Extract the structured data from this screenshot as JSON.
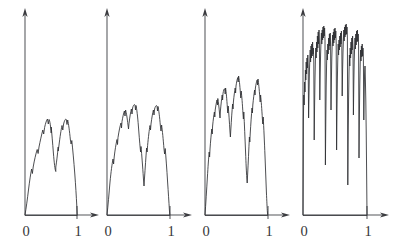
{
  "figure": {
    "title": "",
    "background_color": "#ffffff",
    "ink_color": "#2d2e32",
    "axis_color": "#55565a",
    "width": 399,
    "height": 245,
    "panel_count": 4
  },
  "chart_data": {
    "type": "line",
    "title": "",
    "xlabel": "",
    "ylabel": "",
    "xlim": [
      0,
      1
    ],
    "ylim": [
      0,
      1
    ],
    "grid": false,
    "legend": null,
    "shared_tick_labels": [
      "0",
      "1"
    ],
    "shared_tick_x": [
      0,
      1
    ],
    "panels": [
      {
        "name": "iteration-1",
        "index": 0,
        "label_zero": "0",
        "label_one": "1",
        "peak_height": 0.46,
        "detail_level": 1,
        "origin_px": [
          25,
          215
        ],
        "unit_x_px": 77,
        "axis_top_px": 8,
        "path": "M25,215 C26.2,208 27.4,199 28.6,189 C29.6,181 30.6,174 31.6,169 L32.4,173.5 L33.2,167 C34.4,160 35.8,154 37.2,149.5 L38.1,153.5 L39.0,147 C40.2,141 41.5,135 42.8,130 L43.7,134 L44.6,127.5 C45.6,123 46.6,120 47.5,119 L48.3,124 L49.1,119.5 C49.9,121 50.6,126 51.2,133 L51.2,133 L51.2,127 C51.9,134 52.6,143 53.4,153 C54.2,163 55.0,170 55.8,171.5 L55.8,171.5 L55.8,167 C56.6,162 57.4,155 58.2,147 L58.2,147 L58.2,151 L59.0,145 C60.0,137 61.0,130 62.0,125.5 L62.8,130 L63.6,124 C64.6,120 65.5,118.5 66.3,119.5 L67.0,124.5 L67.7,120 C68.6,124 69.5,131 70.4,140 L71.1,144 L71.8,140.5 C72.8,150 73.8,161 74.8,174 C75.6,185 76.3,196 76.8,206 L77.2,215 Z"
      },
      {
        "name": "iteration-2",
        "index": 1,
        "label_zero": "0",
        "label_one": "1",
        "peak_height": 0.6,
        "detail_level": 2,
        "origin_px": [
          107,
          215
        ],
        "unit_x_px": 170,
        "axis_top_px": 8,
        "path": "M107,215 C108,206 109,194 110,182 C111,172 112,164 113,159 L113.6,164 L114.2,157 C115,150 116,144 117,139.5 L117.5,144.5 L118,137.5 C119,131 120,126 121,123 L121.5,128 L122,121.5 C122.8,117 123.6,113 124.4,111 L125,116 L125.6,110 C126.4,113 127.2,118 128,125 L128.5,129 L129,123.5 C129.8,117 130.6,112 131.4,109 L132,114 L132.6,108 C133.4,105 134.2,104 135,105 L135.5,110 L136,105.5 C136.8,109 137.6,116 138.4,126 C139,134 139.6,142 140.2,148 L140.6,152 L141,146.5 C141.8,155 142.6,166 143.4,178 L144,186 L144.5,178 C145.2,168 145.9,157 146.6,148 L147.1,152 L147.6,145.5 C148.4,137 149.2,130 150,125.5 L150.5,130 L151,124 C151.8,118 152.6,113 153.4,110 L154,115 L154.6,109 C155.4,106 156.2,105 157,106 L157.5,111 L158,106.5 C158.8,110 159.6,117 160.4,126 L161,131 L161.6,125 C162.4,131 163.2,139 164,149 L164.6,154 L165.2,148.5 C166,158 166.8,169 167.6,182 C168.3,192 168.9,202 169.4,210 L169.8,215 Z"
      },
      {
        "name": "iteration-3",
        "index": 2,
        "label_zero": "0",
        "label_one": "1",
        "peak_height": 0.72,
        "detail_level": 3,
        "origin_px": [
          205,
          215
        ],
        "unit_x_px": 268,
        "axis_top_px": 8,
        "path": "M205,215 C205.8,204 206.6,190 207.4,177 C208,167 208.6,158 209.2,152 L209.6,157 L210,149 C210.6,141 211.2,134 211.8,129 L212.2,134 L212.6,126 C213.2,120 213.8,115 214.4,112 L214.8,117 L215.2,110 C215.8,106 216.4,102 217,100 L217.4,105 L217.8,98.5 C218.4,102 219,107 219.6,114 L220,118 L220.4,111 C221,104 221.6,99 222.2,95 L222.6,100 L223,93.5 C223.6,90 224.2,88 224.8,89 L225.2,94 L225.6,88 C226.2,92 226.8,99 227.4,108 L227.8,113 L228.2,106 C228.8,113 229.4,122 230,132 L230.4,137 L230.8,130 C231.4,120 232,111 232.6,104 L233,109 L233.4,102 C234,96 234.6,91 235.2,88 L235.6,93 L236,86 C236.6,82 237.2,79 237.8,77.5 L238.2,82 L238.6,76 C239.2,79 239.8,85 240.4,93 L240.8,98 L241.2,91 C241.8,96 242.4,104 243,114 L243.4,119 L243.8,112 C244.4,124 245,138 245.6,153 C246,163 246.4,172 246.8,178 L247.2,183 L247.6,175 C248.2,163 248.8,150 249.4,137 L249.8,142 L250.2,134 C250.8,124 251.4,115 252,108 L252.4,113 L252.8,105 C253.4,99 254,94 254.6,90 L255,95 L255.4,88 C256,84 256.6,81 257.2,80 L257.6,85 L258,79 C258.6,83 259.2,89 259.8,97 L260.2,102 L260.6,95 C261.2,101 261.8,109 262.4,119 L262.8,124 L263.2,117 C263.8,128 264.4,141 265,156 C265.5,168 266,180 266.4,192 C266.8,201 267.1,208 267.4,212 L267.7,215 Z"
      },
      {
        "name": "iteration-4",
        "index": 3,
        "label_zero": "0",
        "label_one": "1",
        "peak_height": 0.95,
        "detail_level": 4,
        "origin_px": [
          303,
          215
        ],
        "unit_x_px": 367,
        "axis_top_px": 8,
        "path": "M303,215 L303.4,120 L303.8,95 L304.2,105 L304.6,82 L305,92 L305.4,70 L305.8,80 L306.2,62 L306.6,74 L307,58 L307.4,68 L307.8,55 L308.2,66 L308.6,118 L309,95 L309.4,72 L309.8,60 L310.2,50 L310.6,62 L311,46 L311.4,58 L311.8,44 L312.2,56 L312.6,42 L313,54 L313.4,48 L313.8,62 L314.2,140 L314.6,105 L315,78 L315.4,60 L315.8,48 L316.2,58 L316.6,42 L317,52 L317.4,36 L317.8,48 L318.2,32 L318.6,44 L319,30 L319.4,42 L319.8,100 L320.2,74 L320.6,54 L321,42 L321.4,33 L321.8,44 L322.2,30 L322.6,40 L323,27 L323.4,38 L323.8,26 L324.2,36 L324.6,28 L325,40 L325.4,165 L325.8,120 L326.2,86 L326.6,64 L327,50 L327.4,60 L327.8,44 L328.2,54 L328.6,38 L329,50 L329.4,34 L329.8,46 L330.2,33 L330.6,45 L331,110 L331.4,80 L331.8,58 L332.2,45 L332.6,35 L333,46 L333.4,32 L333.8,43 L334.2,29 L334.6,40 L335,28 L335.4,38 L335.8,31 L336.2,43 L336.6,150 L337,108 L337.4,78 L337.8,58 L338.2,44 L338.6,55 L339,40 L339.4,50 L339.8,36 L340.2,47 L340.6,33 L341,44 L341.4,31 L341.8,42 L342.2,96 L342.6,70 L343,52 L343.4,40 L343.8,30 L344.2,41 L344.6,27 L345,37 L345.4,25 L345.8,35 L346.2,24 L346.6,34 L347,27 L347.4,38 L347.8,185 L348.2,135 L348.6,98 L349,72 L349.4,55 L349.8,66 L350.2,48 L350.6,58 L351,42 L351.4,54 L351.8,38 L352.2,50 L352.6,36 L353,48 L353.4,115 L353.8,84 L354.2,62 L354.6,48 L355,38 L355.4,49 L355.8,34 L356.2,45 L356.6,31 L357,42 L357.4,30 L357.8,41 L358.2,34 L358.6,46 L359,158 L359.4,115 L359.8,84 L360.2,64 L360.6,50 L361,61 L361.4,46 L361.8,57 L362.2,44 L362.6,56 L363,48 L363.4,60 L363.8,120 L364.2,92 L364.6,74 L365,66 L365.4,80 L365.8,100 L366.2,130 L366.6,170 L367,215 Z"
      }
    ]
  }
}
